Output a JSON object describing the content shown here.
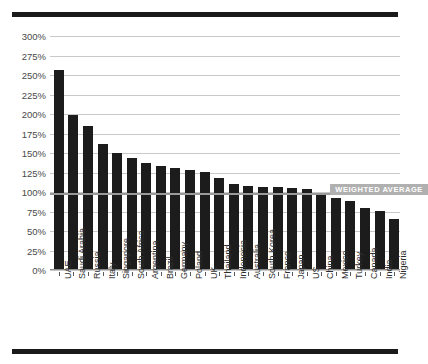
{
  "chart_data": {
    "type": "bar",
    "title": "",
    "subtitle": "",
    "xlabel": "",
    "ylabel": "",
    "ylim": [
      0,
      300
    ],
    "y_tick_step": 25,
    "grid": true,
    "legend_position": "none",
    "orientation": "vertical",
    "bar_color": "#1c1c1c",
    "categories": [
      "UAE",
      "Saudi Arabia",
      "Russia",
      "Italy",
      "Singapore",
      "South Africa",
      "Argentina",
      "Brazil",
      "Germany",
      "Poland",
      "UK",
      "Thailand",
      "Indonesia",
      "Australia",
      "South Korea",
      "France",
      "Japan",
      "US",
      "China",
      "Mexico",
      "Turkey",
      "Canada",
      "India",
      "Nigeria"
    ],
    "values": [
      256,
      199,
      184,
      162,
      150,
      143,
      137,
      133,
      131,
      128,
      126,
      118,
      110,
      108,
      107,
      106,
      105,
      104,
      97,
      92,
      89,
      80,
      76,
      65
    ],
    "ytick_labels": [
      "300%",
      "275%",
      "250%",
      "225%",
      "200%",
      "175%",
      "150%",
      "125%",
      "100%",
      "75%",
      "50%",
      "25%",
      "0%"
    ],
    "ytick_values": [
      300,
      275,
      250,
      225,
      200,
      175,
      150,
      125,
      100,
      75,
      50,
      25,
      0
    ],
    "annotations": [
      {
        "name": "weighted-average",
        "label": "WEIGHTED AVERAGE",
        "value": 97,
        "type": "hline",
        "color": "#9a9a9a",
        "badge_color": "#b0b0b0"
      }
    ]
  },
  "decor": {
    "rule_color": "#1a1a1a"
  }
}
